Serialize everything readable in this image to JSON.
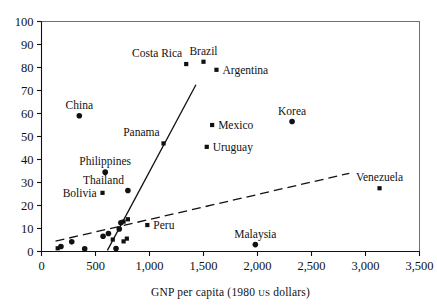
{
  "chart_data": {
    "type": "scatter",
    "title": "",
    "xlabel": "GNP per capita (1980 US dollars)",
    "ylabel": "",
    "xlim": [
      0,
      3500
    ],
    "ylim": [
      0,
      100
    ],
    "xticks": [
      0,
      500,
      1000,
      1500,
      2000,
      2500,
      3000,
      3500
    ],
    "xtick_labels": [
      "0",
      "500",
      "1,000",
      "1,500",
      "2,000",
      "2,500",
      "3,000",
      "3,500"
    ],
    "yticks": [
      0,
      10,
      20,
      30,
      40,
      50,
      60,
      70,
      80,
      90,
      100
    ],
    "ytick_labels": [
      "0",
      "10",
      "20",
      "30",
      "40",
      "50",
      "60",
      "70",
      "80",
      "90",
      "100"
    ],
    "grid": false,
    "legend": "none",
    "marker_color": "#111111",
    "points": [
      {
        "label": "Costa Rica",
        "x": 1340,
        "y": 81.5,
        "marker": "square",
        "label_pos": "above-left"
      },
      {
        "label": "Brazil",
        "x": 1500,
        "y": 82.5,
        "marker": "square",
        "label_pos": "above"
      },
      {
        "label": "Argentina",
        "x": 1620,
        "y": 79.0,
        "marker": "square",
        "label_pos": "right"
      },
      {
        "label": "China",
        "x": 350,
        "y": 59.0,
        "marker": "circle",
        "label_pos": "above"
      },
      {
        "label": "Korea",
        "x": 2320,
        "y": 56.5,
        "marker": "circle",
        "label_pos": "above"
      },
      {
        "label": "Mexico",
        "x": 1580,
        "y": 55.0,
        "marker": "square",
        "label_pos": "right"
      },
      {
        "label": "Panama",
        "x": 1130,
        "y": 47.0,
        "marker": "square",
        "label_pos": "above-left"
      },
      {
        "label": "Uruguay",
        "x": 1530,
        "y": 45.5,
        "marker": "square",
        "label_pos": "right"
      },
      {
        "label": "Philippines",
        "x": 590,
        "y": 34.5,
        "marker": "circle",
        "label_pos": "above"
      },
      {
        "label": "Venezuela",
        "x": 3130,
        "y": 27.5,
        "marker": "square",
        "label_pos": "above"
      },
      {
        "label": "Thailand",
        "x": 800,
        "y": 26.5,
        "marker": "circle",
        "label_pos": "above-left"
      },
      {
        "label": "Bolivia",
        "x": 565,
        "y": 25.5,
        "marker": "square",
        "label_pos": "left"
      },
      {
        "label": "Peru",
        "x": 980,
        "y": 11.5,
        "marker": "square",
        "label_pos": "right"
      },
      {
        "label": "Malaysia",
        "x": 1980,
        "y": 3.0,
        "marker": "circle",
        "label_pos": "above"
      },
      {
        "label": "",
        "x": 800,
        "y": 14.0,
        "marker": "square",
        "label_pos": "none"
      },
      {
        "label": "",
        "x": 760,
        "y": 13.0,
        "marker": "square",
        "label_pos": "none"
      },
      {
        "label": "",
        "x": 735,
        "y": 12.5,
        "marker": "circle",
        "label_pos": "none"
      },
      {
        "label": "",
        "x": 720,
        "y": 9.8,
        "marker": "circle",
        "label_pos": "none"
      },
      {
        "label": "",
        "x": 620,
        "y": 7.8,
        "marker": "circle",
        "label_pos": "none"
      },
      {
        "label": "",
        "x": 570,
        "y": 6.6,
        "marker": "circle",
        "label_pos": "none"
      },
      {
        "label": "",
        "x": 280,
        "y": 4.2,
        "marker": "circle",
        "label_pos": "none"
      },
      {
        "label": "",
        "x": 180,
        "y": 2.2,
        "marker": "circle",
        "label_pos": "none"
      },
      {
        "label": "",
        "x": 150,
        "y": 1.4,
        "marker": "square",
        "label_pos": "none"
      },
      {
        "label": "",
        "x": 660,
        "y": 5.2,
        "marker": "square",
        "label_pos": "none"
      },
      {
        "label": "",
        "x": 790,
        "y": 5.6,
        "marker": "square",
        "label_pos": "none"
      },
      {
        "label": "",
        "x": 760,
        "y": 4.4,
        "marker": "square",
        "label_pos": "none"
      },
      {
        "label": "",
        "x": 400,
        "y": 1.2,
        "marker": "circle",
        "label_pos": "none"
      },
      {
        "label": "",
        "x": 690,
        "y": 1.3,
        "marker": "circle",
        "label_pos": "none"
      }
    ],
    "fit_lines": [
      {
        "name": "solid-regression",
        "style": "solid",
        "x1": 610,
        "y1": 0.5,
        "x2": 1430,
        "y2": 72.5
      },
      {
        "name": "dashed-regression",
        "style": "dashed",
        "x1": 130,
        "y1": 4.5,
        "x2": 2850,
        "y2": 34.0
      }
    ]
  }
}
